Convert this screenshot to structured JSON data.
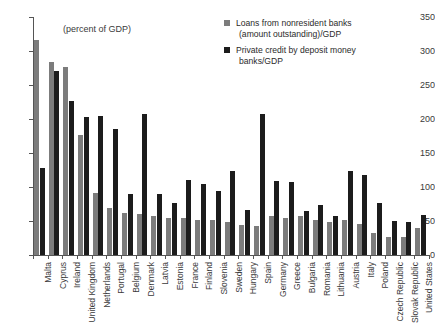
{
  "chart_data": {
    "type": "bar",
    "title": "",
    "subtitle": "",
    "annotation": "(percent of GDP)",
    "xlabel": "",
    "ylabel": "",
    "ylim": [
      0,
      350
    ],
    "yticks": [
      0,
      50,
      100,
      150,
      200,
      250,
      300,
      350
    ],
    "ytick_labels": [
      "0",
      "50",
      "100",
      "150",
      "200",
      "250",
      "300",
      "350"
    ],
    "grid": false,
    "legend_position": "top-right",
    "categories": [
      "Malta",
      "Cyprus",
      "Ireland",
      "United Kingdom",
      "Netherlands",
      "Portugal",
      "Belgium",
      "Denmark",
      "Latvia",
      "Estonia",
      "France",
      "Finland",
      "Slovenia",
      "Sweden",
      "Hungary",
      "Spain",
      "Germany",
      "Greece",
      "Bulgaria",
      "Romania",
      "Lithuania",
      "Austria",
      "Italy",
      "Poland",
      "Czech Republic",
      "Slovak Republic",
      "United States"
    ],
    "series": [
      {
        "name": "Loans from nonresident banks (amount outstanding)/GDP",
        "color": "#7c7c7c",
        "values": [
          316,
          284,
          276,
          177,
          91,
          69,
          62,
          60,
          58,
          55,
          54,
          52,
          51,
          48,
          44,
          43,
          58,
          55,
          58,
          52,
          49,
          52,
          45,
          32,
          26,
          27,
          40
        ]
      },
      {
        "name": "Private credit by deposit money banks/GDP",
        "color": "#1c1c1c",
        "values": [
          128,
          271,
          227,
          203,
          205,
          186,
          89,
          207,
          89,
          77,
          111,
          104,
          94,
          124,
          66,
          207,
          109,
          108,
          64,
          73,
          57,
          123,
          118,
          77,
          50,
          48,
          59
        ]
      }
    ]
  },
  "legend": {
    "entries": [
      {
        "line1": "Loans from nonresident banks",
        "line2": "(amount outstanding)/GDP",
        "color": "#7c7c7c"
      },
      {
        "line1": "Private credit by deposit money",
        "line2": "banks/GDP",
        "color": "#1c1c1c"
      }
    ]
  },
  "colors": {
    "series_gray": "#7c7c7c",
    "series_black": "#1c1c1c",
    "axis": "#555555",
    "text": "#3a3a3a",
    "background": "#ffffff"
  }
}
